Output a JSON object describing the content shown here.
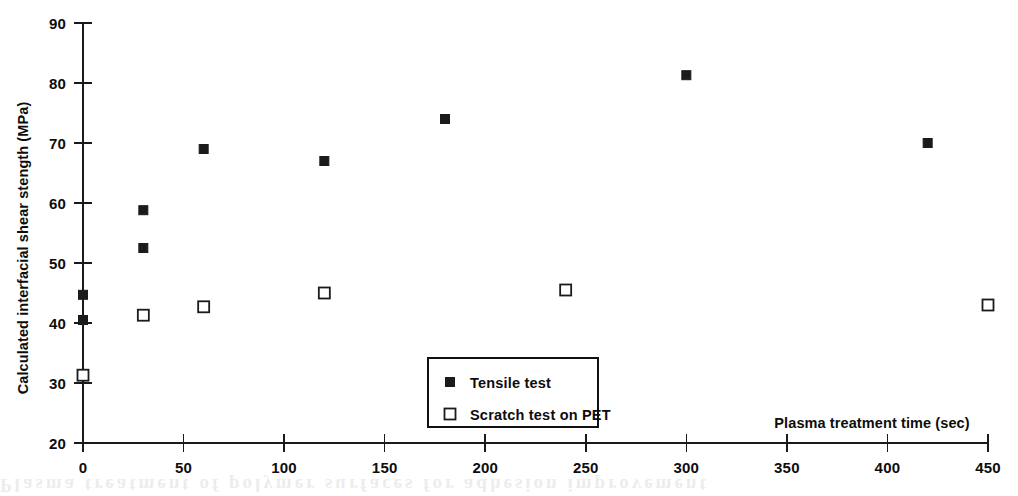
{
  "chart_data": {
    "type": "scatter",
    "title": "",
    "xlabel": "Plasma treatment time (sec)",
    "ylabel": "Calculated interfacial shear stength (MPa)",
    "xlim": [
      0,
      450
    ],
    "ylim": [
      20,
      90
    ],
    "xticks": [
      0,
      50,
      100,
      150,
      200,
      250,
      300,
      350,
      400,
      450
    ],
    "yticks": [
      20,
      30,
      40,
      50,
      60,
      70,
      80,
      90
    ],
    "xtick_labels": [
      "0",
      "50",
      "100",
      "150",
      "200",
      "250",
      "300",
      "350",
      "400",
      "450"
    ],
    "ytick_labels": [
      "20",
      "30",
      "40",
      "50",
      "60",
      "70",
      "80",
      "90"
    ],
    "grid": false,
    "legend_position": "lower center",
    "series": [
      {
        "name": "Tensile test",
        "marker": "filled-square",
        "color": "#1b1b1b",
        "points": [
          {
            "x": 0,
            "y": 44.7
          },
          {
            "x": 0,
            "y": 40.5
          },
          {
            "x": 30,
            "y": 58.8
          },
          {
            "x": 30,
            "y": 52.5
          },
          {
            "x": 60,
            "y": 69.0
          },
          {
            "x": 120,
            "y": 67.0
          },
          {
            "x": 180,
            "y": 74.0
          },
          {
            "x": 300,
            "y": 81.3
          },
          {
            "x": 420,
            "y": 70.0
          }
        ]
      },
      {
        "name": "Scratch test on PET",
        "marker": "open-square",
        "color": "#1b1b1b",
        "points": [
          {
            "x": 0,
            "y": 31.3
          },
          {
            "x": 30,
            "y": 41.3
          },
          {
            "x": 60,
            "y": 42.7
          },
          {
            "x": 120,
            "y": 45.0
          },
          {
            "x": 240,
            "y": 45.5
          },
          {
            "x": 450,
            "y": 43.0
          }
        ]
      }
    ]
  },
  "legend": {
    "entries": [
      {
        "label": "Tensile test",
        "marker": "filled-square"
      },
      {
        "label": "Scratch test on PET",
        "marker": "open-square"
      }
    ]
  },
  "artifact": {
    "bleed_text": "Plasma treatment of polymer surfaces for adhesion improvement"
  }
}
